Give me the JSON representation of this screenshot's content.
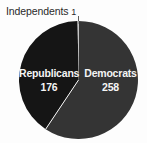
{
  "chart_data": {
    "type": "pie",
    "title": "",
    "categories": [
      "Republicans",
      "Democrats",
      "Independents"
    ],
    "values": [
      176,
      258,
      1
    ],
    "labels": [
      "176",
      "258",
      "1"
    ],
    "total": 435,
    "legend_position": "none",
    "grid": false,
    "slices": [
      {
        "name": "Republicans",
        "label": "Republicans",
        "value": 176,
        "value_label": "176",
        "color": "#151515",
        "percent": 40.5,
        "start_angle_deg": 0,
        "end_angle_deg": 145.6,
        "label_position": "inside"
      },
      {
        "name": "Democrats",
        "label": "Democrats",
        "value": 258,
        "value_label": "258",
        "color": "#343434",
        "percent": 59.3,
        "start_angle_deg": 145.6,
        "end_angle_deg": 358.7,
        "label_position": "inside"
      },
      {
        "name": "Independents",
        "label": "Independents",
        "value": 1,
        "value_label": "1",
        "color": "#f2f2f2",
        "percent": 0.2,
        "start_angle_deg": 358.7,
        "end_angle_deg": 360,
        "label_position": "outside-callout"
      }
    ]
  },
  "callout": {
    "independents_label": "Independents",
    "independents_value": "1"
  },
  "slice_labels": {
    "republicans_name": "Republicans",
    "republicans_value": "176",
    "democrats_name": "Democrats",
    "democrats_value": "258"
  },
  "colors": {
    "background": "#fdfdfd",
    "republicans": "#151515",
    "democrats": "#343434",
    "independents": "#f2f2f2",
    "divider": "#f5f5f5",
    "label_text": "#f4f4f4",
    "callout_text": "#2a2a2a",
    "leader_line": "#5d5d5d"
  }
}
